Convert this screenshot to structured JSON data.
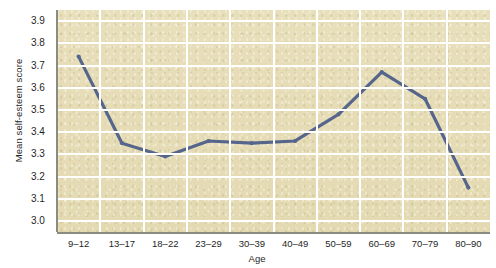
{
  "chart_data": {
    "type": "line",
    "title": "",
    "xlabel": "Age",
    "ylabel": "Mean self-esteem score",
    "categories": [
      "9–12",
      "13–17",
      "18–22",
      "23–29",
      "30–39",
      "40–49",
      "50–59",
      "60–69",
      "70–79",
      "80–90"
    ],
    "values": [
      3.74,
      3.35,
      3.29,
      3.36,
      3.35,
      3.36,
      3.48,
      3.67,
      3.55,
      3.15
    ],
    "series": [
      {
        "name": "Mean self-esteem score",
        "values": [
          3.74,
          3.35,
          3.29,
          3.36,
          3.35,
          3.36,
          3.48,
          3.67,
          3.55,
          3.15
        ]
      }
    ],
    "ylim": [
      2.95,
      3.95
    ],
    "yticks": [
      "3.0",
      "3.1",
      "3.2",
      "3.3",
      "3.4",
      "3.5",
      "3.6",
      "3.7",
      "3.8",
      "3.9"
    ],
    "ytick_values": [
      3.0,
      3.1,
      3.2,
      3.3,
      3.4,
      3.5,
      3.6,
      3.7,
      3.8,
      3.9
    ],
    "grid": true,
    "grid_color": "#ffffff",
    "legend": "none",
    "line_color": "#56658c",
    "marker": "dot",
    "plot_background": "#e6ddb7",
    "page_background": "#ffffff"
  }
}
